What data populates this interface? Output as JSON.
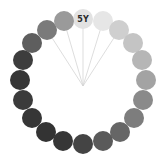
{
  "diagram": {
    "title": "Grayscale hue circle",
    "center": {
      "x": 83,
      "y": 86
    },
    "chip_radius": 10,
    "highlighted_label": "5Y",
    "line_color": "#d4d4d4",
    "chips": [
      {
        "x": 83,
        "y": 19,
        "color": "#e2e2e2",
        "label": "5Y",
        "line": true
      },
      {
        "x": 103,
        "y": 21,
        "color": "#e6e6e6",
        "label": "",
        "line": true
      },
      {
        "x": 119,
        "y": 30,
        "color": "#cfcfcf",
        "label": "",
        "line": true
      },
      {
        "x": 133,
        "y": 43,
        "color": "#c4c4c4",
        "label": "",
        "line": false
      },
      {
        "x": 142,
        "y": 60,
        "color": "#b6b6b6",
        "label": "",
        "line": false
      },
      {
        "x": 146,
        "y": 80,
        "color": "#a3a3a3",
        "label": "",
        "line": false
      },
      {
        "x": 143,
        "y": 100,
        "color": "#8a8a8a",
        "label": "",
        "line": false
      },
      {
        "x": 134,
        "y": 118,
        "color": "#7d7d7d",
        "label": "",
        "line": false
      },
      {
        "x": 120,
        "y": 132,
        "color": "#666666",
        "label": "",
        "line": false
      },
      {
        "x": 103,
        "y": 141,
        "color": "#5a5a5a",
        "label": "",
        "line": false
      },
      {
        "x": 83,
        "y": 144,
        "color": "#444444",
        "label": "",
        "line": false
      },
      {
        "x": 63,
        "y": 141,
        "color": "#363636",
        "label": "",
        "line": false
      },
      {
        "x": 46,
        "y": 132,
        "color": "#333333",
        "label": "",
        "line": false
      },
      {
        "x": 32,
        "y": 118,
        "color": "#363636",
        "label": "",
        "line": false
      },
      {
        "x": 23,
        "y": 100,
        "color": "#3b3b3b",
        "label": "",
        "line": false
      },
      {
        "x": 20,
        "y": 80,
        "color": "#363636",
        "label": "",
        "line": false
      },
      {
        "x": 23,
        "y": 60,
        "color": "#3d3d3d",
        "label": "",
        "line": false
      },
      {
        "x": 32,
        "y": 43,
        "color": "#5e5e5e",
        "label": "",
        "line": false
      },
      {
        "x": 47,
        "y": 30,
        "color": "#7a7a7a",
        "label": "",
        "line": true
      },
      {
        "x": 64,
        "y": 21,
        "color": "#9a9a9a",
        "label": "",
        "line": true
      }
    ]
  }
}
